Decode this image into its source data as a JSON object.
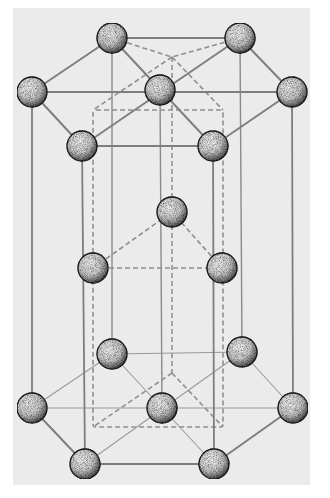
{
  "diagram": {
    "colors": {
      "background": "#ffffff",
      "panel": "#ebebeb",
      "bond": "#8a8a8a",
      "dashed": "#8f8f8f",
      "atom_fill": "#d9d9d9",
      "atom_edge": "#1a1a1a"
    },
    "atoms": [
      {
        "id": "t1",
        "x": 112,
        "y": 38,
        "layer": "top"
      },
      {
        "id": "t2",
        "x": 240,
        "y": 38,
        "layer": "top"
      },
      {
        "id": "t3",
        "x": 32,
        "y": 92,
        "layer": "top"
      },
      {
        "id": "t4",
        "x": 160,
        "y": 90,
        "layer": "top"
      },
      {
        "id": "t5",
        "x": 292,
        "y": 92,
        "layer": "top"
      },
      {
        "id": "t6",
        "x": 82,
        "y": 146,
        "layer": "top"
      },
      {
        "id": "t7",
        "x": 213,
        "y": 146,
        "layer": "top"
      },
      {
        "id": "m1",
        "x": 172,
        "y": 212,
        "layer": "middle"
      },
      {
        "id": "m2",
        "x": 93,
        "y": 268,
        "layer": "middle"
      },
      {
        "id": "m3",
        "x": 222,
        "y": 268,
        "layer": "middle"
      },
      {
        "id": "b1",
        "x": 112,
        "y": 354,
        "layer": "bottom"
      },
      {
        "id": "b2",
        "x": 242,
        "y": 352,
        "layer": "bottom"
      },
      {
        "id": "b3",
        "x": 32,
        "y": 408,
        "layer": "bottom"
      },
      {
        "id": "b4",
        "x": 162,
        "y": 408,
        "layer": "bottom"
      },
      {
        "id": "b5",
        "x": 293,
        "y": 408,
        "layer": "bottom"
      },
      {
        "id": "b6",
        "x": 85,
        "y": 464,
        "layer": "bottom"
      },
      {
        "id": "b7",
        "x": 214,
        "y": 464,
        "layer": "bottom"
      }
    ],
    "atom_radius": 15
  }
}
